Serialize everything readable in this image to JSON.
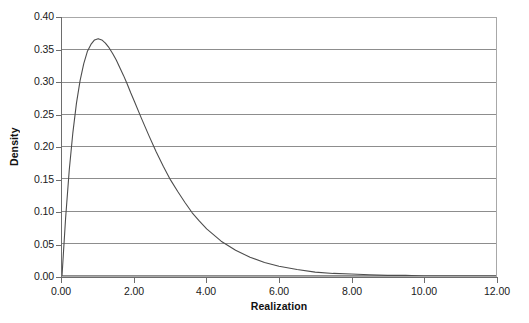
{
  "chart_data": {
    "type": "line",
    "title": "",
    "xlabel": "Realization",
    "ylabel": "Density",
    "xlim": [
      0.0,
      12.0
    ],
    "ylim": [
      0.0,
      0.4
    ],
    "grid": "horizontal",
    "legend": "none",
    "curve_description": "Gamma density, shape 2, scale 1: f(x) = x*exp(-x); peak 0.368 at x = 1.00",
    "x_ticks": [
      "0.00",
      "2.00",
      "4.00",
      "6.00",
      "8.00",
      "10.00",
      "12.00"
    ],
    "x_tick_values": [
      0.0,
      2.0,
      4.0,
      6.0,
      8.0,
      10.0,
      12.0
    ],
    "y_ticks": [
      "0.00",
      "0.05",
      "0.10",
      "0.15",
      "0.20",
      "0.25",
      "0.30",
      "0.35",
      "0.40"
    ],
    "y_tick_values": [
      0.0,
      0.05,
      0.1,
      0.15,
      0.2,
      0.25,
      0.3,
      0.35,
      0.4
    ],
    "series": [
      {
        "name": "Density",
        "color": "#4d4d4d",
        "x": [
          0.0,
          0.1,
          0.2,
          0.3,
          0.4,
          0.5,
          0.6,
          0.7,
          0.8,
          0.9,
          1.0,
          1.1,
          1.2,
          1.3,
          1.4,
          1.5,
          1.6,
          1.7,
          1.8,
          1.9,
          2.0,
          2.2,
          2.4,
          2.6,
          2.8,
          3.0,
          3.2,
          3.4,
          3.6,
          3.8,
          4.0,
          4.4,
          4.8,
          5.2,
          5.6,
          6.0,
          6.5,
          7.0,
          7.5,
          8.0,
          8.5,
          9.0,
          9.5,
          10.0,
          10.5,
          11.0,
          11.5,
          12.0
        ],
        "values": [
          0.0,
          0.09,
          0.164,
          0.222,
          0.268,
          0.303,
          0.329,
          0.348,
          0.359,
          0.366,
          0.368,
          0.366,
          0.361,
          0.354,
          0.345,
          0.335,
          0.323,
          0.311,
          0.298,
          0.284,
          0.271,
          0.244,
          0.218,
          0.193,
          0.17,
          0.149,
          0.131,
          0.114,
          0.098,
          0.085,
          0.073,
          0.054,
          0.04,
          0.029,
          0.021,
          0.015,
          0.01,
          0.006,
          0.004,
          0.003,
          0.002,
          0.001,
          0.001,
          0.0,
          0.0,
          0.0,
          0.0,
          0.0
        ]
      }
    ],
    "colors": {
      "curve": "#4d4d4d",
      "gridline": "#8c8c8c",
      "axis": "#6d6d6d",
      "frame": "#a8a8a8",
      "text": "#1a1a1a",
      "background": "#ffffff"
    }
  }
}
